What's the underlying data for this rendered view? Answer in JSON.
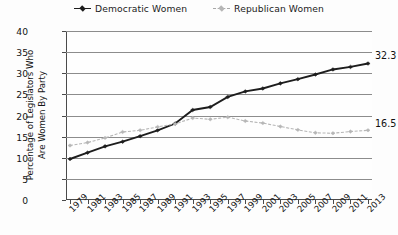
{
  "legend": {
    "position": "top-center",
    "items": [
      {
        "label": "Democratic Women",
        "key": "dem",
        "color": "#1d1d1d",
        "marker": "diamond",
        "style": "solid"
      },
      {
        "label": "Republican Women",
        "key": "rep",
        "color": "#b6b6b6",
        "marker": "diamond",
        "style": "dashed"
      }
    ]
  },
  "axes": {
    "ylabel_line1": "Percentage of Legislators Who",
    "ylabel_line2": "Are Women By Party",
    "xlabel": "",
    "yticks": [
      "0",
      "5",
      "10",
      "15",
      "20",
      "25",
      "30",
      "35",
      "40"
    ],
    "xticks": [
      "1979",
      "1981",
      "1983",
      "1985",
      "1987",
      "1989",
      "1991",
      "1993",
      "1995",
      "1997",
      "1999",
      "2001",
      "2003",
      "2005",
      "2007",
      "2009",
      "2011",
      "2013"
    ]
  },
  "annotations": [
    {
      "name": "democratic-end-value",
      "text": "32.3",
      "series": "dem"
    },
    {
      "name": "republican-end-value",
      "text": "16.5",
      "series": "rep"
    }
  ],
  "chart_data": {
    "type": "line",
    "title": "",
    "xlabel": "",
    "ylabel": "Percentage of Legislators Who Are Women By Party",
    "ylim": [
      0,
      40
    ],
    "ytick_step": 5,
    "grid": true,
    "legend_position": "top-center",
    "categories": [
      "1979",
      "1981",
      "1983",
      "1985",
      "1987",
      "1989",
      "1991",
      "1993",
      "1995",
      "1997",
      "1999",
      "2001",
      "2003",
      "2005",
      "2007",
      "2009",
      "2011",
      "2013"
    ],
    "series": [
      {
        "name": "Democratic Women",
        "color": "#1d1d1d",
        "linestyle": "solid",
        "marker": "diamond",
        "values": [
          9.7,
          11.2,
          12.7,
          13.8,
          15.1,
          16.5,
          18.1,
          21.3,
          22.0,
          24.4,
          25.7,
          26.4,
          27.6,
          28.6,
          29.7,
          30.9,
          31.5,
          32.3
        ],
        "end_label": "32.3"
      },
      {
        "name": "Republican Women",
        "color": "#b6b6b6",
        "linestyle": "dashed",
        "marker": "diamond",
        "values": [
          12.9,
          13.6,
          14.7,
          16.1,
          16.5,
          17.3,
          18.0,
          19.4,
          19.1,
          19.6,
          18.7,
          18.2,
          17.4,
          16.6,
          15.9,
          15.8,
          16.2,
          16.5
        ],
        "end_label": "16.5"
      }
    ]
  }
}
